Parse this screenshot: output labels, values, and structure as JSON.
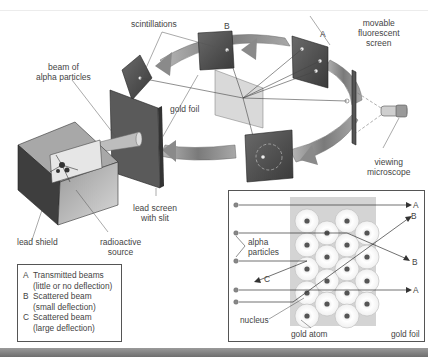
{
  "diagram": {
    "title_implied": "Rutherford gold foil experiment",
    "apparatus_labels": {
      "scintillations": "scintillations",
      "screen_b": "B",
      "screen_a": "A",
      "movable_screen_line1": "movable",
      "movable_screen_line2": "fluorescent",
      "movable_screen_line3": "screen",
      "beam_line1": "beam of",
      "beam_line2": "alpha particles",
      "gold_foil": "gold foil",
      "viewing_line1": "viewing",
      "viewing_line2": "microscope",
      "lead_screen_line1": "lead screen",
      "lead_screen_line2": "with slit",
      "lead_shield": "lead shield",
      "source_line1": "radioactive",
      "source_line2": "source"
    },
    "legend": {
      "items": [
        {
          "key": "A",
          "line1": "Transmitted beams",
          "line2": "(little or no deflection)"
        },
        {
          "key": "B",
          "line1": "Scattered beam",
          "line2": "(small deflection)"
        },
        {
          "key": "C",
          "line1": "Scattered beam",
          "line2": "(large deflection)"
        }
      ]
    },
    "inset": {
      "alpha_line1": "alpha",
      "alpha_line2": "particles",
      "nucleus": "nucleus",
      "gold_atom": "gold atom",
      "gold_foil": "gold foil",
      "beam_labels": [
        "A",
        "B",
        "B",
        "A",
        "C"
      ]
    },
    "colors": {
      "screen_dark": "#4a4a4a",
      "ring_gray": "#8c8c8c",
      "foil_gray": "#d4d4d4",
      "atom_fill": "#f4f4f4",
      "nucleus": "#555555",
      "line": "#444444"
    }
  }
}
